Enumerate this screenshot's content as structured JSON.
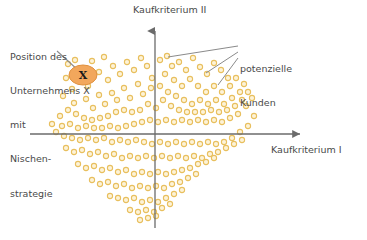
{
  "figure": {
    "type": "scatter",
    "background_color": "#ffffff",
    "axis_color": "#6b6b6b",
    "text_color": "#4a4a4a",
    "dot_stroke_color": "#e8bf5e",
    "dot_fill_color": "#fdf3d8",
    "marker_fill_color": "#f2a75c",
    "marker_edge_color": "#e0913f",
    "leader_line_color": "#8a8a8a"
  },
  "axes": {
    "y_axis_label": "Kaufkriterium II",
    "x_axis_label": "Kaufkriterium I",
    "origin": {
      "x": 155,
      "y": 134
    },
    "x_axis": {
      "x_start": 30,
      "x_end": 306,
      "y": 134,
      "arrow_at": "end"
    },
    "y_axis": {
      "y_start": 228,
      "y_end": 25,
      "x": 155,
      "arrow_at": "top"
    }
  },
  "annotations": {
    "company": {
      "lines": [
        "Position des",
        "Unternehmens X",
        "mit",
        "Nischen-",
        "strategie"
      ],
      "full_text": "Position des Unternehmens X mit Nischenstrategie",
      "leader_line": {
        "x1": 57,
        "y1": 51,
        "x2": 79,
        "y2": 71
      }
    },
    "customers": {
      "lines": [
        "potenzielle",
        "Kunden"
      ],
      "full_text": "potenzielle Kunden",
      "leader_lines": [
        {
          "x1": 238,
          "y1": 46,
          "x2": 168,
          "y2": 57
        },
        {
          "x1": 238,
          "y1": 52,
          "x2": 206,
          "y2": 73
        },
        {
          "x1": 238,
          "y1": 58,
          "x2": 218,
          "y2": 85
        }
      ]
    }
  },
  "marker": {
    "label": "X",
    "center": {
      "x": 83,
      "y": 75
    },
    "radius_x": 14,
    "radius_y": 10
  },
  "chart_data": {
    "type": "scatter",
    "title": "",
    "xlabel": "Kaufkriterium I",
    "ylabel": "Kaufkriterium II",
    "grid": false,
    "legend": "none",
    "annotations": [
      "Position des Unternehmens X mit Nischenstrategie",
      "potenzielle Kunden"
    ],
    "series": [
      {
        "name": "Unternehmen X (Nischenstrategie)",
        "marker": "filled-ellipse-with-X",
        "points": [
          [
            83,
            75
          ]
        ]
      },
      {
        "name": "potenzielle Kunden",
        "marker": "open-circle",
        "points": [
          [
            68,
            64
          ],
          [
            75,
            60
          ],
          [
            92,
            61
          ],
          [
            104,
            57
          ],
          [
            113,
            66
          ],
          [
            99,
            72
          ],
          [
            88,
            86
          ],
          [
            72,
            89
          ],
          [
            66,
            78
          ],
          [
            108,
            80
          ],
          [
            120,
            74
          ],
          [
            127,
            62
          ],
          [
            134,
            70
          ],
          [
            141,
            58
          ],
          [
            147,
            66
          ],
          [
            152,
            78
          ],
          [
            138,
            84
          ],
          [
            124,
            88
          ],
          [
            112,
            93
          ],
          [
            99,
            95
          ],
          [
            86,
            99
          ],
          [
            74,
            103
          ],
          [
            63,
            96
          ],
          [
            93,
            108
          ],
          [
            105,
            104
          ],
          [
            117,
            100
          ],
          [
            130,
            98
          ],
          [
            143,
            94
          ],
          [
            151,
            88
          ],
          [
            160,
            60
          ],
          [
            167,
            56
          ],
          [
            172,
            66
          ],
          [
            179,
            62
          ],
          [
            186,
            70
          ],
          [
            193,
            58
          ],
          [
            200,
            67
          ],
          [
            207,
            74
          ],
          [
            214,
            63
          ],
          [
            221,
            70
          ],
          [
            228,
            78
          ],
          [
            165,
            74
          ],
          [
            174,
            80
          ],
          [
            182,
            86
          ],
          [
            190,
            79
          ],
          [
            198,
            86
          ],
          [
            206,
            92
          ],
          [
            214,
            86
          ],
          [
            222,
            92
          ],
          [
            230,
            86
          ],
          [
            236,
            78
          ],
          [
            160,
            86
          ],
          [
            168,
            92
          ],
          [
            176,
            96
          ],
          [
            184,
            100
          ],
          [
            192,
            104
          ],
          [
            200,
            100
          ],
          [
            208,
            104
          ],
          [
            216,
            100
          ],
          [
            224,
            104
          ],
          [
            232,
            98
          ],
          [
            240,
            92
          ],
          [
            244,
            84
          ],
          [
            163,
            100
          ],
          [
            171,
            106
          ],
          [
            179,
            110
          ],
          [
            187,
            112
          ],
          [
            195,
            112
          ],
          [
            203,
            112
          ],
          [
            211,
            110
          ],
          [
            219,
            112
          ],
          [
            227,
            110
          ],
          [
            235,
            106
          ],
          [
            242,
            100
          ],
          [
            248,
            92
          ],
          [
            156,
            108
          ],
          [
            148,
            104
          ],
          [
            140,
            110
          ],
          [
            132,
            112
          ],
          [
            124,
            110
          ],
          [
            116,
            112
          ],
          [
            108,
            116
          ],
          [
            100,
            118
          ],
          [
            92,
            120
          ],
          [
            84,
            118
          ],
          [
            76,
            114
          ],
          [
            68,
            110
          ],
          [
            60,
            116
          ],
          [
            52,
            124
          ],
          [
            62,
            126
          ],
          [
            70,
            124
          ],
          [
            78,
            128
          ],
          [
            86,
            126
          ],
          [
            94,
            128
          ],
          [
            102,
            128
          ],
          [
            110,
            126
          ],
          [
            118,
            128
          ],
          [
            126,
            126
          ],
          [
            134,
            124
          ],
          [
            142,
            122
          ],
          [
            150,
            120
          ],
          [
            158,
            122
          ],
          [
            166,
            120
          ],
          [
            174,
            122
          ],
          [
            182,
            120
          ],
          [
            190,
            122
          ],
          [
            198,
            120
          ],
          [
            206,
            122
          ],
          [
            214,
            120
          ],
          [
            222,
            122
          ],
          [
            230,
            118
          ],
          [
            238,
            114
          ],
          [
            246,
            106
          ],
          [
            252,
            98
          ],
          [
            56,
            132
          ],
          [
            64,
            136
          ],
          [
            72,
            138
          ],
          [
            80,
            140
          ],
          [
            88,
            138
          ],
          [
            96,
            140
          ],
          [
            104,
            138
          ],
          [
            112,
            142
          ],
          [
            120,
            140
          ],
          [
            128,
            142
          ],
          [
            136,
            140
          ],
          [
            144,
            142
          ],
          [
            152,
            144
          ],
          [
            160,
            142
          ],
          [
            168,
            144
          ],
          [
            176,
            142
          ],
          [
            184,
            144
          ],
          [
            192,
            142
          ],
          [
            200,
            144
          ],
          [
            208,
            142
          ],
          [
            216,
            144
          ],
          [
            224,
            142
          ],
          [
            232,
            138
          ],
          [
            240,
            132
          ],
          [
            248,
            126
          ],
          [
            254,
            116
          ],
          [
            66,
            148
          ],
          [
            74,
            152
          ],
          [
            82,
            150
          ],
          [
            90,
            154
          ],
          [
            98,
            152
          ],
          [
            106,
            156
          ],
          [
            114,
            154
          ],
          [
            122,
            158
          ],
          [
            130,
            156
          ],
          [
            138,
            158
          ],
          [
            146,
            156
          ],
          [
            154,
            158
          ],
          [
            162,
            156
          ],
          [
            170,
            158
          ],
          [
            178,
            156
          ],
          [
            186,
            158
          ],
          [
            194,
            156
          ],
          [
            202,
            158
          ],
          [
            210,
            154
          ],
          [
            218,
            152
          ],
          [
            226,
            148
          ],
          [
            234,
            144
          ],
          [
            242,
            140
          ],
          [
            78,
            164
          ],
          [
            86,
            168
          ],
          [
            94,
            166
          ],
          [
            102,
            170
          ],
          [
            110,
            168
          ],
          [
            118,
            172
          ],
          [
            126,
            170
          ],
          [
            134,
            174
          ],
          [
            142,
            172
          ],
          [
            150,
            174
          ],
          [
            158,
            172
          ],
          [
            166,
            174
          ],
          [
            174,
            172
          ],
          [
            182,
            170
          ],
          [
            190,
            168
          ],
          [
            198,
            164
          ],
          [
            206,
            162
          ],
          [
            214,
            158
          ],
          [
            92,
            180
          ],
          [
            100,
            184
          ],
          [
            108,
            182
          ],
          [
            116,
            186
          ],
          [
            124,
            184
          ],
          [
            132,
            188
          ],
          [
            140,
            186
          ],
          [
            148,
            188
          ],
          [
            156,
            186
          ],
          [
            164,
            188
          ],
          [
            172,
            184
          ],
          [
            180,
            182
          ],
          [
            188,
            178
          ],
          [
            196,
            174
          ],
          [
            110,
            196
          ],
          [
            118,
            198
          ],
          [
            126,
            200
          ],
          [
            134,
            198
          ],
          [
            142,
            202
          ],
          [
            150,
            200
          ],
          [
            158,
            202
          ],
          [
            166,
            198
          ],
          [
            174,
            194
          ],
          [
            182,
            190
          ],
          [
            130,
            210
          ],
          [
            138,
            212
          ],
          [
            146,
            210
          ],
          [
            154,
            212
          ],
          [
            162,
            208
          ],
          [
            170,
            204
          ],
          [
            148,
            218
          ],
          [
            156,
            216
          ],
          [
            140,
            220
          ]
        ]
      }
    ]
  }
}
